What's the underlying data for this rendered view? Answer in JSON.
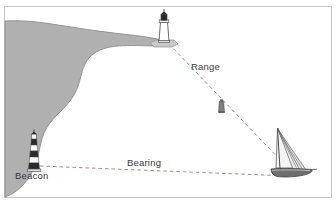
{
  "figure": {
    "kind": "nautical-navigation-diagram",
    "background_color": "#ffffff",
    "frame_color": "#c9c9c9",
    "land_color": "#b0b0b0",
    "land_edge_color": "#8a8a8a",
    "sea_color": "#ffffff",
    "line_color": "#b08a8a",
    "text_color": "#3b3b3b"
  },
  "labels": {
    "range": "Range",
    "bearing": "Bearing",
    "beacon": "Beacon"
  },
  "objects": {
    "lighthouse": {
      "name": "Lighthouse",
      "tower_color": "#ffffff",
      "lantern_color": "#2b2b2b",
      "outline_color": "#4a4a4a"
    },
    "beacon_tower": {
      "name": "Beacon",
      "band_dark_color": "#2b2b2b",
      "band_light_color": "#ffffff",
      "outline_color": "#4a4a4a"
    },
    "buoy": {
      "name": "Buoy",
      "body_color": "#7a7a7a",
      "outline_color": "#4a4a4a"
    },
    "sailboat": {
      "name": "Sailing yacht",
      "hull_color": "#6e6e6e",
      "sail_color": "#f2f2f2",
      "rig_color": "#5a5a5a"
    }
  },
  "lines": {
    "range_line": {
      "label": "Range",
      "from": "lighthouse",
      "to": "sailboat",
      "style": "dashed"
    },
    "bearing_line": {
      "label": "Bearing",
      "from": "beacon",
      "to": "sailboat",
      "style": "dashed"
    }
  }
}
